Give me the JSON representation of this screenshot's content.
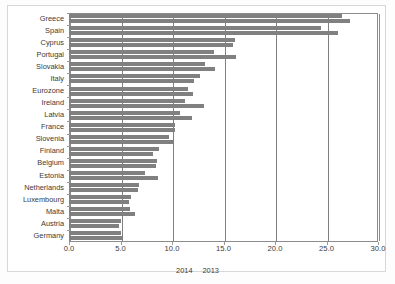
{
  "chart_data": {
    "type": "bar",
    "orientation": "horizontal",
    "title": "",
    "subtitle": "",
    "xlabel": "",
    "ylabel": "",
    "xlim": [
      0.0,
      30.0
    ],
    "xticks": [
      "0.0",
      "5.0",
      "10.0",
      "15.0",
      "20.0",
      "25.0",
      "30.0"
    ],
    "xtick_values": [
      0,
      5,
      10,
      15,
      20,
      25,
      30
    ],
    "grid": true,
    "legend_position": "bottom",
    "categories": [
      "Greece",
      "Spain",
      "Cyprus",
      "Portugal",
      "Slovakia",
      "Italy",
      "Eurozone",
      "Ireland",
      "Latvia",
      "France",
      "Slovenia",
      "Finland",
      "Belgium",
      "Estonia",
      "Netherlands",
      "Luxembourg",
      "Malta",
      "Austria",
      "Germany"
    ],
    "series": [
      {
        "name": "2014",
        "color": "#808080",
        "values": [
          26.5,
          24.5,
          16.1,
          14.1,
          13.2,
          12.7,
          11.6,
          11.3,
          10.8,
          10.3,
          9.7,
          8.7,
          8.5,
          7.4,
          6.8,
          6.0,
          5.9,
          5.0,
          5.0
        ]
      },
      {
        "name": "2013",
        "color": "#808080",
        "values": [
          27.3,
          26.1,
          15.9,
          16.2,
          14.2,
          12.1,
          12.0,
          13.1,
          11.9,
          10.3,
          10.1,
          8.2,
          8.4,
          8.6,
          6.7,
          5.8,
          6.4,
          4.9,
          5.2
        ]
      }
    ]
  },
  "legend": {
    "items": [
      {
        "label": "2014"
      },
      {
        "label": "2013"
      }
    ]
  }
}
